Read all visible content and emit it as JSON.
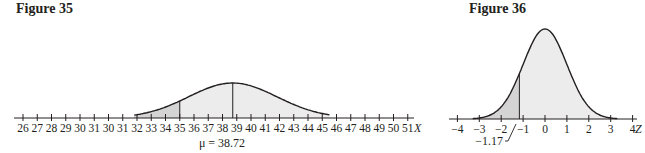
{
  "figures": [
    {
      "title": "Figure 35",
      "axis_variable": "X",
      "tick_labels": [
        "26",
        "27",
        "28",
        "29",
        "30",
        "31",
        "30",
        "31",
        "32",
        "33",
        "34",
        "35",
        "36",
        "37",
        "38",
        "39",
        "40",
        "41",
        "42",
        "43",
        "44",
        "45",
        "46",
        "47",
        "48",
        "49",
        "50",
        "51"
      ],
      "annotation": "μ = 38.72"
    },
    {
      "title": "Figure 36",
      "axis_variable": "Z",
      "tick_labels": [
        "−4",
        "−3",
        "−2",
        "−1",
        "0",
        "1",
        "2",
        "3",
        "4"
      ],
      "annotation": "−1.17"
    }
  ],
  "colors": {
    "line": "#231f20",
    "light_fill": "#ececec",
    "dark_fill": "#d4d4d4"
  },
  "chart_data": [
    {
      "type": "area",
      "title": "Figure 35",
      "xlabel": "X",
      "ylabel": "",
      "distribution": "normal",
      "mean": 38.72,
      "x_tick_labels": [
        "26",
        "27",
        "28",
        "29",
        "30",
        "31",
        "30",
        "31",
        "32",
        "33",
        "34",
        "35",
        "36",
        "37",
        "38",
        "39",
        "40",
        "41",
        "42",
        "43",
        "44",
        "45",
        "46",
        "47",
        "48",
        "49",
        "50",
        "51"
      ],
      "curve_range": [
        32,
        45.5
      ],
      "shaded_regions": [
        {
          "from": 32,
          "to": 35,
          "shade": "dark"
        },
        {
          "from": 35,
          "to": 45.5,
          "shade": "light"
        }
      ],
      "vertical_lines": [
        35,
        38.72
      ],
      "annotations": [
        "μ = 38.72"
      ],
      "grid": false
    },
    {
      "type": "area",
      "title": "Figure 36",
      "xlabel": "Z",
      "ylabel": "",
      "distribution": "standard normal",
      "mean": 0,
      "x_tick_labels": [
        "−4",
        "−3",
        "−2",
        "−1",
        "0",
        "1",
        "2",
        "3",
        "4"
      ],
      "xlim": [
        -4,
        4
      ],
      "shaded_regions": [
        {
          "from": -3.3,
          "to": -1.17,
          "shade": "dark"
        },
        {
          "from": -1.17,
          "to": 3.3,
          "shade": "light"
        }
      ],
      "vertical_lines": [
        -1.17
      ],
      "annotations": [
        "−1.17"
      ],
      "grid": false
    }
  ]
}
